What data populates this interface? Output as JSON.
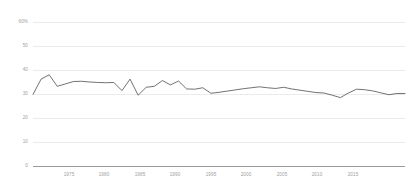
{
  "chart_data": {
    "type": "line",
    "title": "",
    "subtitle": "",
    "xlabel": "",
    "ylabel": "",
    "ylim": [
      0,
      60
    ],
    "xlim": [
      1972,
      2018
    ],
    "grid": true,
    "legend_position": "none",
    "y_ticks": [
      0,
      10,
      20,
      30,
      40,
      50,
      60
    ],
    "y_tick_labels": [
      "0",
      "10",
      "20",
      "30",
      "40",
      "50",
      "60%"
    ],
    "x_ticks": [
      1975,
      1980,
      1985,
      1990,
      1995,
      2000,
      2005,
      2010,
      2015
    ],
    "x_tick_labels": [
      "1975",
      "1980",
      "1985",
      "1990",
      "1995",
      "2000",
      "2005",
      "2010",
      "2015"
    ],
    "series": [
      {
        "name": "series-1",
        "color": "#59595c",
        "x": [
          1972,
          1973,
          1974,
          1975,
          1976,
          1977,
          1978,
          1979,
          1980,
          1981,
          1982,
          1983,
          1984,
          1985,
          1986,
          1987,
          1988,
          1989,
          1990,
          1991,
          1992,
          1993,
          1994,
          1995,
          1996,
          1997,
          1998,
          1999,
          2000,
          2001,
          2002,
          2003,
          2004,
          2005,
          2006,
          2007,
          2008,
          2009,
          2010,
          2011,
          2012,
          2013,
          2014,
          2015,
          2016,
          2017,
          2018
        ],
        "values": [
          29.8,
          36.2,
          38.0,
          33.2,
          34.2,
          35.2,
          35.3,
          35.0,
          34.8,
          34.7,
          34.8,
          31.4,
          36.2,
          29.5,
          32.8,
          33.2,
          35.6,
          33.8,
          35.4,
          32.1,
          32.0,
          32.6,
          30.3,
          30.7,
          31.2,
          31.7,
          32.2,
          32.6,
          33.0,
          32.6,
          32.3,
          32.8,
          32.1,
          31.6,
          31.1,
          30.6,
          30.4,
          29.5,
          28.5,
          30.4,
          32.0,
          31.8,
          31.3,
          30.5,
          29.7,
          30.2,
          30.2
        ]
      }
    ]
  }
}
